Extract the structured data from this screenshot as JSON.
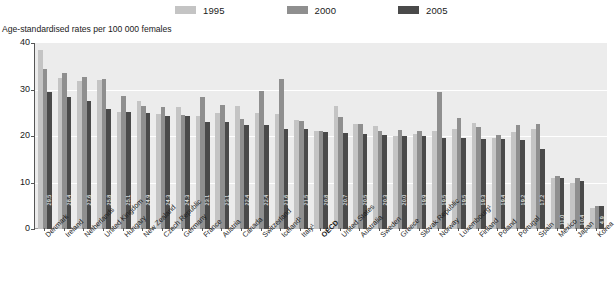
{
  "legend": {
    "items": [
      {
        "label": "1995",
        "color": "#c4c4c4"
      },
      {
        "label": "2000",
        "color": "#8f8f8f"
      },
      {
        "label": "2005",
        "color": "#4a4a4a"
      }
    ]
  },
  "axis_title": "Age-standardised rates per 100 000 females",
  "yticks": [
    "0",
    "10",
    "20",
    "30",
    "40"
  ],
  "chart_data": {
    "type": "bar",
    "title": "",
    "subtitle": "",
    "xlabel": "",
    "ylabel": "Age-standardised rates per 100 000 females",
    "ylim": [
      0,
      40
    ],
    "yticks": [
      0,
      10,
      20,
      30,
      40
    ],
    "grid": true,
    "legend_position": "top",
    "categories": [
      "Denmark",
      "Ireland",
      "Netherlands",
      "United Kingdom",
      "Hungary",
      "New Zealand",
      "Czech Republic",
      "Germany",
      "France",
      "Austria",
      "Canada",
      "Switzerland",
      "Iceland¹",
      "Italy¹",
      "OECD",
      "United States",
      "Australia",
      "Sweden",
      "Greece",
      "Slovak Republic",
      "Norway",
      "Luxembourg¹",
      "Finland",
      "Poland",
      "Portugal",
      "Spain",
      "Mexico",
      "Japan",
      "Korea"
    ],
    "emphasised_category": "OECD",
    "series": [
      {
        "name": "1995",
        "color": "#c4c4c4",
        "values": [
          38.6,
          32.4,
          31.9,
          32.0,
          25.2,
          27.6,
          24.8,
          26.3,
          24.2,
          25.0,
          26.4,
          25.0,
          24.7,
          23.5,
          21.1,
          26.4,
          22.6,
          22.2,
          20.0,
          20.4,
          21.0,
          21.5,
          22.8,
          19.5,
          20.8,
          21.6,
          11.0,
          10.0,
          4.6
        ]
      },
      {
        "name": "2000",
        "color": "#8f8f8f",
        "values": [
          34.5,
          33.6,
          32.7,
          32.2,
          28.5,
          26.5,
          26.3,
          24.6,
          28.3,
          26.7,
          23.7,
          29.6,
          32.2,
          23.2,
          21.1,
          24.1,
          22.6,
          21.1,
          21.2,
          21.0,
          29.5,
          23.8,
          21.9,
          20.2,
          22.4,
          22.5,
          11.5,
          10.9,
          5.0
        ]
      },
      {
        "name": "2005",
        "color": "#4a4a4a",
        "values": [
          29.5,
          28.4,
          27.6,
          25.8,
          25.1,
          24.9,
          24.3,
          24.3,
          23.1,
          23.1,
          22.4,
          22.4,
          21.6,
          21.5,
          20.8,
          20.7,
          20.5,
          20.3,
          20.0,
          19.9,
          19.5,
          19.5,
          19.3,
          19.4,
          19.2,
          17.2,
          11.0,
          10.4,
          4.9
        ]
      }
    ],
    "data_labels_series": "2005",
    "data_labels": [
      "29.5",
      "28.4",
      "27.6",
      "25.8",
      "25.1",
      "24.9",
      "24.3",
      "24.3",
      "23.1",
      "23.1",
      "22.4",
      "22.4",
      "21.6",
      "21.5",
      "20.8",
      "20.7",
      "20.5",
      "20.3",
      "20.0",
      "19.9",
      "19.5",
      "19.5",
      "19.3",
      "19.4",
      "19.2",
      "17.2",
      "11.0",
      "10.4",
      "4.9"
    ]
  }
}
